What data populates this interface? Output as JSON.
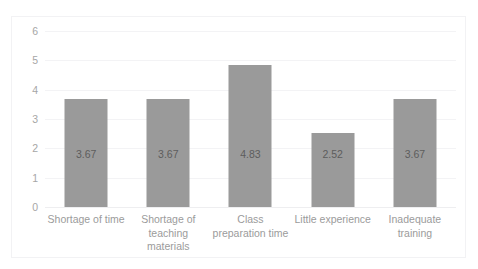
{
  "caption_remnant": {
    "seg1": "",
    "seg2": "",
    "seg3": ""
  },
  "chart_data": {
    "type": "bar",
    "title": "",
    "subtitle": "",
    "xlabel": "",
    "ylabel": "",
    "categories": [
      "Shortage of time",
      "Shortage of teaching materials",
      "Class preparation time",
      "Little experience",
      "Inadequate training"
    ],
    "values": [
      3.67,
      3.67,
      4.83,
      2.52,
      3.67
    ],
    "data_labels": [
      "3.67",
      "3.67",
      "4.83",
      "2.52",
      "3.67"
    ],
    "ylim": [
      0,
      6
    ],
    "yticks": [
      6,
      5,
      4,
      3,
      2,
      1,
      0
    ],
    "ytick_labels": [
      "6",
      "5",
      "4",
      "3",
      "2",
      "1",
      "0"
    ],
    "grid": "horizontal",
    "legend": "none",
    "orientation": "vertical",
    "bar_color": "#9a9a9a",
    "gridline_color": "#f3f3f5",
    "axis_text_color": "#a6a6a6",
    "value_text_color": "#5d5d5d",
    "plot_background": "#ffffff"
  }
}
